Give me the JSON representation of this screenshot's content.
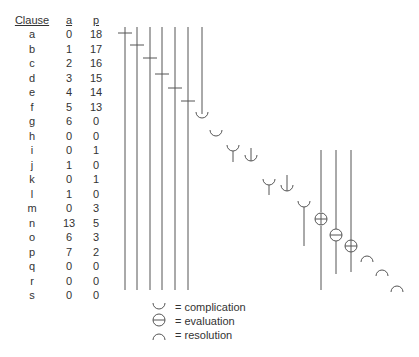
{
  "table": {
    "headers": {
      "clause": "Clause",
      "a": "a",
      "p": "p"
    },
    "rows": [
      {
        "clause": "a",
        "a": "0",
        "p": "18"
      },
      {
        "clause": "b",
        "a": "1",
        "p": "17"
      },
      {
        "clause": "c",
        "a": "2",
        "p": "16"
      },
      {
        "clause": "d",
        "a": "3",
        "p": "15"
      },
      {
        "clause": "e",
        "a": "4",
        "p": "14"
      },
      {
        "clause": "f",
        "a": "5",
        "p": "13"
      },
      {
        "clause": "g",
        "a": "6",
        "p": "0"
      },
      {
        "clause": "h",
        "a": "0",
        "p": "0"
      },
      {
        "clause": "i",
        "a": "0",
        "p": "1"
      },
      {
        "clause": "j",
        "a": "1",
        "p": "0"
      },
      {
        "clause": "k",
        "a": "0",
        "p": "1"
      },
      {
        "clause": "l",
        "a": "1",
        "p": "0"
      },
      {
        "clause": "m",
        "a": "0",
        "p": "3"
      },
      {
        "clause": "n",
        "a": "13",
        "p": "5"
      },
      {
        "clause": "o",
        "a": "6",
        "p": "3"
      },
      {
        "clause": "p",
        "a": "7",
        "p": "2"
      },
      {
        "clause": "q",
        "a": "0",
        "p": "0"
      },
      {
        "clause": "r",
        "a": "0",
        "p": "0"
      },
      {
        "clause": "s",
        "a": "0",
        "p": "0"
      }
    ]
  },
  "diagram": {
    "line_color": "#555555",
    "orientation_clauses": [
      "a",
      "b",
      "c",
      "d",
      "e",
      "f"
    ],
    "complication_clauses": [
      "g",
      "h",
      "i",
      "j",
      "k",
      "l",
      "m"
    ],
    "evaluation_clauses": [
      "n",
      "o",
      "p"
    ],
    "resolution_clauses": [
      "q",
      "r",
      "s"
    ]
  },
  "legend": {
    "items": [
      {
        "symbol": "complication-icon",
        "label": "= complication"
      },
      {
        "symbol": "evaluation-icon",
        "label": "= evaluation"
      },
      {
        "symbol": "resolution-icon",
        "label": "= resolution"
      }
    ]
  }
}
